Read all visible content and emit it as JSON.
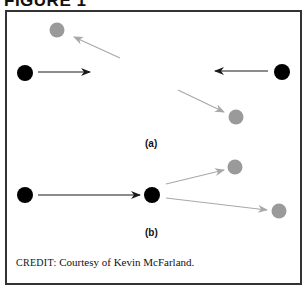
{
  "figure": {
    "title": "FIGURE 1",
    "credit_prefix": "CREDIT:",
    "credit_text": " Courtesy of Kevin McFarland."
  },
  "panels": [
    {
      "label": "(a)",
      "description": "Two black particles approach each other head-on; after collision two gray particles move away.",
      "particles": [
        {
          "role": "incoming",
          "color": "#000000",
          "x": 25,
          "y": 73
        },
        {
          "role": "incoming",
          "color": "#000000",
          "x": 282,
          "y": 72
        },
        {
          "role": "outgoing",
          "color": "#9a9a9a",
          "x": 57,
          "y": 30
        },
        {
          "role": "outgoing",
          "color": "#9a9a9a",
          "x": 236,
          "y": 117
        }
      ]
    },
    {
      "label": "(b)",
      "description": "A black particle strikes a stationary black particle; two gray particles scatter forward.",
      "particles": [
        {
          "role": "incoming",
          "color": "#000000",
          "x": 25,
          "y": 195
        },
        {
          "role": "target",
          "color": "#000000",
          "x": 152,
          "y": 195
        },
        {
          "role": "outgoing",
          "color": "#9a9a9a",
          "x": 235,
          "y": 167
        },
        {
          "role": "outgoing",
          "color": "#9a9a9a",
          "x": 279,
          "y": 211
        }
      ]
    }
  ],
  "colors": {
    "incoming": "#000000",
    "outgoing": "#9a9a9a",
    "arrow_dark": "#1a1a1a",
    "arrow_light": "#a8a8a8",
    "frame": "#333333"
  }
}
